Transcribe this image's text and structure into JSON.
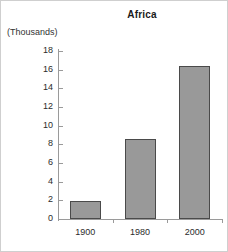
{
  "chart_data": {
    "type": "bar",
    "title": "Africa",
    "xlabel": "",
    "ylabel": "(Thousands)",
    "categories": [
      "1900",
      "1980",
      "2000"
    ],
    "values": [
      1.9,
      8.6,
      16.4
    ],
    "ylim": [
      0,
      18
    ],
    "ytick_step": 2,
    "ytick_labels": [
      "0",
      "2",
      "4",
      "6",
      "8",
      "10",
      "12",
      "14",
      "16",
      "18"
    ],
    "grid": false,
    "legend": false,
    "series": [
      {
        "name": "Africa",
        "values": [
          1.9,
          8.6,
          16.4
        ]
      }
    ],
    "bar_fill_color": "#999999",
    "bar_border_color": "#4a4a4a",
    "axis_color": "#9a9a9a",
    "text_color": "#2b2b2b",
    "background_color": "#ffffff"
  }
}
